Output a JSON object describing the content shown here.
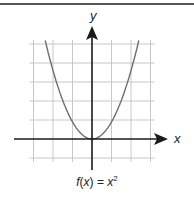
{
  "chart_data": {
    "type": "line",
    "title": "",
    "caption": "f(x) = x²",
    "caption_parts": {
      "f": "f",
      "lp": "(",
      "x": "x",
      "rp": ")",
      "eq": " = ",
      "base": "x",
      "exp": "2"
    },
    "xlabel": "x",
    "ylabel": "y",
    "function": "x^2",
    "xlim": [
      -3,
      3
    ],
    "ylim": [
      -1,
      5
    ],
    "grid": true,
    "x_gridlines": [
      -3,
      -2,
      -1,
      0,
      1,
      2,
      3
    ],
    "y_gridlines": [
      -1,
      0,
      1,
      2,
      3,
      4,
      5
    ],
    "x": [
      -2.4,
      -2,
      -1.5,
      -1,
      -0.5,
      0,
      0.5,
      1,
      1.5,
      2,
      2.4
    ],
    "series": [
      {
        "name": "f(x) = x^2",
        "values": [
          5.76,
          4,
          2.25,
          1,
          0.25,
          0,
          0.25,
          1,
          2.25,
          4,
          5.76
        ]
      }
    ],
    "colors": {
      "grid": "#c8c8c8",
      "axis": "#1a1a1a",
      "curve": "#6e6e6e"
    }
  }
}
